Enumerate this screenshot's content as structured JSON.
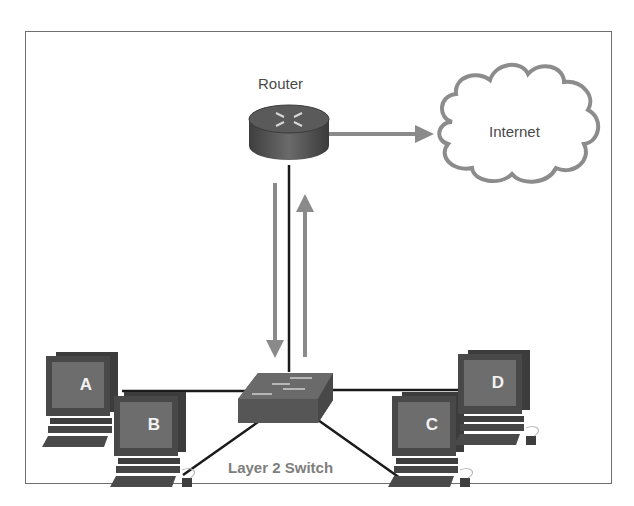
{
  "diagram": {
    "router": {
      "label": "Router",
      "icon": "router-icon"
    },
    "cloud": {
      "label": "Internet",
      "icon": "cloud-icon"
    },
    "switch": {
      "label": "Layer 2 Switch",
      "icon": "switch-icon"
    },
    "hosts": [
      {
        "id": "A",
        "label": "A"
      },
      {
        "id": "B",
        "label": "B"
      },
      {
        "id": "C",
        "label": "C"
      },
      {
        "id": "D",
        "label": "D"
      }
    ],
    "links": [
      {
        "from": "Router",
        "to": "Internet",
        "arrow": "to-internet"
      },
      {
        "from": "Router",
        "to": "Layer 2 Switch",
        "arrows": [
          "down",
          "up"
        ]
      },
      {
        "from": "Layer 2 Switch",
        "to": "A"
      },
      {
        "from": "Layer 2 Switch",
        "to": "B"
      },
      {
        "from": "Layer 2 Switch",
        "to": "C"
      },
      {
        "from": "Layer 2 Switch",
        "to": "D"
      }
    ],
    "colors": {
      "device": "#555555",
      "arrow": "#8a8a8a",
      "cloud_stroke": "#8c8c8c",
      "link": "#1a1a1a",
      "frame": "#6e6e6e"
    }
  }
}
